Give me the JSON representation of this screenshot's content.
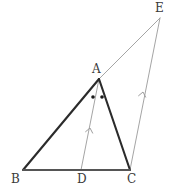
{
  "figure": {
    "background_color": "#ffffff",
    "width": 173,
    "height": 193,
    "stroke_colors": {
      "primary_triangle": "#2b2b2b",
      "baseline": "#555555",
      "construction": "#9a9a9a",
      "angle_mark": "#1a1a1a",
      "label_text": "#3a3a3a"
    },
    "stroke_widths": {
      "primary_triangle": 2.1,
      "baseline": 2.0,
      "construction": 0.9,
      "arrow_mark": 0.9
    },
    "points": [
      {
        "name": "A",
        "label": "A",
        "x": 99,
        "y": 79,
        "label_x": 92,
        "label_y": 63
      },
      {
        "name": "B",
        "label": "B",
        "x": 23,
        "y": 170,
        "label_x": 11,
        "label_y": 173
      },
      {
        "name": "C",
        "label": "C",
        "x": 130,
        "y": 170,
        "label_x": 127,
        "label_y": 173
      },
      {
        "name": "D",
        "label": "D",
        "x": 81,
        "y": 170,
        "label_x": 77,
        "label_y": 173
      },
      {
        "name": "E",
        "label": "E",
        "x": 160,
        "y": 18,
        "label_x": 155,
        "label_y": 2
      }
    ],
    "segments": [
      {
        "name": "segment-AB",
        "from": "A",
        "to": "B",
        "style": "thick-dark",
        "x1": 99,
        "y1": 79,
        "x2": 23,
        "y2": 170
      },
      {
        "name": "segment-AC",
        "from": "A",
        "to": "C",
        "style": "thick-dark",
        "x1": 99,
        "y1": 79,
        "x2": 130,
        "y2": 170
      },
      {
        "name": "segment-BC",
        "from": "B",
        "to": "C",
        "style": "thick-baseline",
        "x1": 23,
        "y1": 170,
        "x2": 130,
        "y2": 170
      },
      {
        "name": "segment-AE",
        "from": "A",
        "to": "E",
        "style": "thin-construction",
        "x1": 99,
        "y1": 79,
        "x2": 160,
        "y2": 18
      },
      {
        "name": "segment-DA",
        "from": "D",
        "to": "A",
        "style": "thin-construction-arrow",
        "x1": 81,
        "y1": 170,
        "x2": 99,
        "y2": 79
      },
      {
        "name": "segment-CE",
        "from": "C",
        "to": "E",
        "style": "thin-construction-arrow",
        "x1": 130,
        "y1": 170,
        "x2": 160,
        "y2": 18
      }
    ],
    "parallel_arrows": [
      {
        "name": "arrow-mark-DA",
        "on_segment": "segment-DA",
        "x": 90,
        "y": 128,
        "angle_deg": -78.8,
        "count": 1
      },
      {
        "name": "arrow-mark-CE",
        "on_segment": "segment-CE",
        "x": 143,
        "y": 92,
        "angle_deg": -78.8,
        "count": 1
      }
    ],
    "angle_marks": [
      {
        "name": "angle-dot-BAD",
        "shape": "dot",
        "x": 93,
        "y": 97,
        "radius": 1.8
      },
      {
        "name": "angle-dot-DAC",
        "shape": "dot",
        "x": 102,
        "y": 97,
        "radius": 1.8
      }
    ]
  }
}
